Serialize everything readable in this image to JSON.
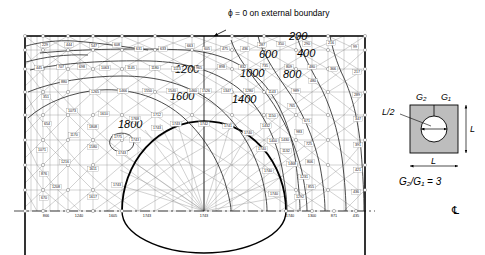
{
  "figure": {
    "type": "fem-contour-plot",
    "top_annotation": "ϕ = 0 on external boundary",
    "centerline_symbol": "℄"
  },
  "contours": {
    "levels": [
      200,
      400,
      600,
      800,
      1000,
      1200,
      1400,
      1600,
      1800
    ],
    "labels": [
      {
        "text": "200",
        "x": 289,
        "y": 40
      },
      {
        "text": "400",
        "x": 297,
        "y": 57
      },
      {
        "text": "600",
        "x": 259,
        "y": 58
      },
      {
        "text": "800",
        "x": 283,
        "y": 78
      },
      {
        "text": "1000",
        "x": 240,
        "y": 77
      },
      {
        "text": "1200",
        "x": 175,
        "y": 73
      },
      {
        "text": "1400",
        "x": 232,
        "y": 103
      },
      {
        "text": "1600",
        "x": 170,
        "y": 100
      },
      {
        "text": "1800",
        "x": 118,
        "y": 128
      }
    ]
  },
  "inset": {
    "label_g2": "G₂",
    "label_g1": "G₁",
    "label_half_l": "L/2",
    "label_l_right": "L",
    "label_l_bottom": "L",
    "ratio_text": "G₂/G₁ = 3"
  },
  "nodal_values": {
    "row1": [
      {
        "v": "229",
        "x": 45,
        "y": 46
      },
      {
        "v": "444",
        "x": 69,
        "y": 46
      },
      {
        "v": "547",
        "x": 94,
        "y": 47
      },
      {
        "v": "608",
        "x": 117,
        "y": 46
      },
      {
        "v": "631",
        "x": 139,
        "y": 50
      },
      {
        "v": "633",
        "x": 163,
        "y": 50
      },
      {
        "v": "663",
        "x": 190,
        "y": 47
      },
      {
        "v": "605",
        "x": 207,
        "y": 50
      },
      {
        "v": "475",
        "x": 225,
        "y": 50
      },
      {
        "v": "436",
        "x": 245,
        "y": 50
      },
      {
        "v": "287",
        "x": 262,
        "y": 46
      },
      {
        "v": "350",
        "x": 281,
        "y": 45
      },
      {
        "v": "290",
        "x": 307,
        "y": 45
      },
      {
        "v": "216",
        "x": 331,
        "y": 44
      },
      {
        "v": "99",
        "x": 355,
        "y": 48
      }
    ],
    "row2": [
      {
        "v": "445",
        "x": 39,
        "y": 69
      },
      {
        "v": "707",
        "x": 61,
        "y": 68
      },
      {
        "v": "698",
        "x": 82,
        "y": 68
      },
      {
        "v": "1063",
        "x": 105,
        "y": 69
      },
      {
        "v": "1145",
        "x": 131,
        "y": 69
      },
      {
        "v": "1180",
        "x": 155,
        "y": 69
      },
      {
        "v": "1113",
        "x": 177,
        "y": 70
      },
      {
        "v": "965",
        "x": 199,
        "y": 69
      },
      {
        "v": "898",
        "x": 222,
        "y": 68
      },
      {
        "v": "832",
        "x": 243,
        "y": 68
      },
      {
        "v": "735",
        "x": 265,
        "y": 67
      },
      {
        "v": "809",
        "x": 289,
        "y": 68
      },
      {
        "v": "480",
        "x": 312,
        "y": 68
      },
      {
        "v": "366",
        "x": 333,
        "y": 70
      },
      {
        "v": "217",
        "x": 357,
        "y": 73
      }
    ],
    "row3": [
      {
        "v": "880",
        "x": 64,
        "y": 83
      },
      {
        "v": "1265",
        "x": 95,
        "y": 93
      },
      {
        "v": "1466",
        "x": 123,
        "y": 92
      },
      {
        "v": "1550",
        "x": 148,
        "y": 92
      },
      {
        "v": "1540",
        "x": 172,
        "y": 92
      },
      {
        "v": "1460",
        "x": 193,
        "y": 92
      },
      {
        "v": "1526",
        "x": 206,
        "y": 92
      },
      {
        "v": "1347",
        "x": 227,
        "y": 92
      },
      {
        "v": "1280",
        "x": 249,
        "y": 92
      },
      {
        "v": "1143",
        "x": 272,
        "y": 93
      },
      {
        "v": "989",
        "x": 296,
        "y": 92
      },
      {
        "v": "480",
        "x": 313,
        "y": 82
      },
      {
        "v": "289",
        "x": 357,
        "y": 96
      }
    ],
    "left_column": [
      {
        "v": "351",
        "x": 46,
        "y": 98
      },
      {
        "v": "1073",
        "x": 72,
        "y": 112
      },
      {
        "v": "654",
        "x": 47,
        "y": 125
      },
      {
        "v": "1170",
        "x": 74,
        "y": 136
      },
      {
        "v": "1071",
        "x": 42,
        "y": 151
      },
      {
        "v": "1216",
        "x": 65,
        "y": 163
      },
      {
        "v": "876",
        "x": 44,
        "y": 175
      },
      {
        "v": "1208",
        "x": 56,
        "y": 188
      },
      {
        "v": "670",
        "x": 44,
        "y": 199
      }
    ],
    "right_column": [
      {
        "v": "765",
        "x": 292,
        "y": 107
      },
      {
        "v": "671",
        "x": 307,
        "y": 122
      },
      {
        "v": "1150",
        "x": 272,
        "y": 117
      },
      {
        "v": "983",
        "x": 299,
        "y": 133
      },
      {
        "v": "725",
        "x": 309,
        "y": 145
      },
      {
        "v": "347",
        "x": 358,
        "y": 120
      },
      {
        "v": "391",
        "x": 358,
        "y": 146
      },
      {
        "v": "806",
        "x": 310,
        "y": 163
      },
      {
        "v": "1132",
        "x": 286,
        "y": 152
      },
      {
        "v": "1231",
        "x": 304,
        "y": 178
      },
      {
        "v": "421",
        "x": 358,
        "y": 171
      },
      {
        "v": "855",
        "x": 311,
        "y": 188
      },
      {
        "v": "1292",
        "x": 300,
        "y": 198
      },
      {
        "v": "436",
        "x": 356,
        "y": 193
      }
    ],
    "inner_region": [
      {
        "v": "1610",
        "x": 104,
        "y": 115
      },
      {
        "v": "1768",
        "x": 135,
        "y": 120
      },
      {
        "v": "1712",
        "x": 157,
        "y": 116
      },
      {
        "v": "1808",
        "x": 93,
        "y": 128
      },
      {
        "v": "1775",
        "x": 118,
        "y": 138
      },
      {
        "v": "1580",
        "x": 93,
        "y": 148
      },
      {
        "v": "1611",
        "x": 93,
        "y": 170
      },
      {
        "v": "1617",
        "x": 93,
        "y": 198
      }
    ],
    "hole_boundary": [
      {
        "v": "1743",
        "x": 157,
        "y": 129
      },
      {
        "v": "1743",
        "x": 176,
        "y": 125
      },
      {
        "v": "1742",
        "x": 204,
        "y": 125
      },
      {
        "v": "1741",
        "x": 228,
        "y": 127
      },
      {
        "v": "1743",
        "x": 135,
        "y": 141
      },
      {
        "v": "1740",
        "x": 248,
        "y": 134
      },
      {
        "v": "1743",
        "x": 122,
        "y": 154
      },
      {
        "v": "1430",
        "x": 285,
        "y": 141
      },
      {
        "v": "1432",
        "x": 266,
        "y": 127
      },
      {
        "v": "1400",
        "x": 273,
        "y": 142
      },
      {
        "v": "1740",
        "x": 262,
        "y": 150
      },
      {
        "v": "1743",
        "x": 117,
        "y": 186
      },
      {
        "v": "1740",
        "x": 268,
        "y": 172
      },
      {
        "v": "1468",
        "x": 292,
        "y": 165
      },
      {
        "v": "1740",
        "x": 274,
        "y": 195
      }
    ],
    "bottom_axis": [
      {
        "v": "866",
        "x": 46,
        "y": 217
      },
      {
        "v": "1240",
        "x": 79,
        "y": 217
      },
      {
        "v": "1605",
        "x": 113,
        "y": 217
      },
      {
        "v": "1743",
        "x": 147,
        "y": 217
      },
      {
        "v": "1743",
        "x": 204,
        "y": 217
      },
      {
        "v": "1740",
        "x": 290,
        "y": 217
      },
      {
        "v": "1300",
        "x": 312,
        "y": 217
      },
      {
        "v": "871",
        "x": 334,
        "y": 217
      },
      {
        "v": "435",
        "x": 356,
        "y": 217
      }
    ]
  }
}
